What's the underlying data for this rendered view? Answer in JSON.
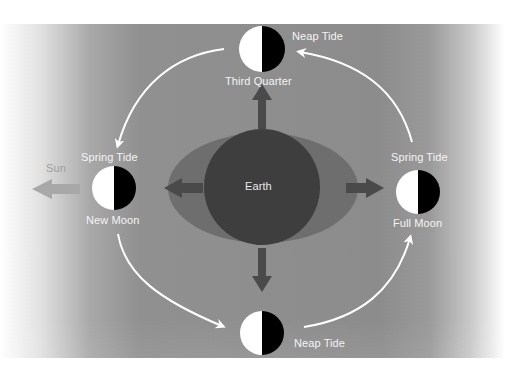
{
  "diagram": {
    "title": "",
    "colors": {
      "background_mid": "#8c8c8c",
      "earth": "#3e3e3e",
      "tidal_bulge": "#6e6e6e",
      "force_arrow": "#4a4a4a",
      "sun_arrow": "#a8a8a8",
      "moon_light": "#ffffff",
      "moon_dark": "#000000",
      "orbit_arrow": "#ffffff",
      "label_text": "#f4f4f4"
    },
    "center": {
      "label": "Earth"
    },
    "sun": {
      "label": "Sun"
    },
    "moons": [
      {
        "id": "top",
        "phase_label": "Third Quarter",
        "tide_label": "Neap Tide"
      },
      {
        "id": "left",
        "phase_label": "New Moon",
        "tide_label": "Spring Tide"
      },
      {
        "id": "right",
        "phase_label": "Full Moon",
        "tide_label": "Spring Tide"
      },
      {
        "id": "bottom",
        "phase_label": "",
        "tide_label": "Neap Tide"
      }
    ]
  }
}
